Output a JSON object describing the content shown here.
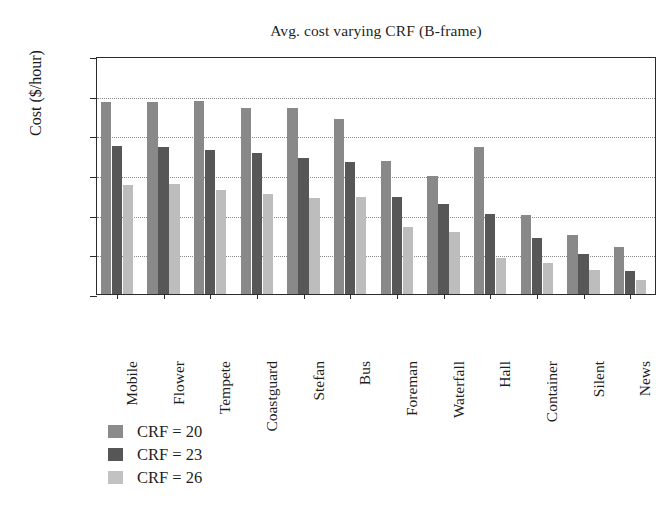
{
  "chart_data": {
    "type": "bar",
    "title": "Avg. cost varying CRF (B-frame)",
    "xlabel": "",
    "ylabel": "Cost ($/hour)",
    "ylim": [
      0.1,
      0.4
    ],
    "yticks": [
      0.1,
      0.15,
      0.2,
      0.25,
      0.3,
      0.35,
      0.4
    ],
    "ytick_labels": [
      "0.1",
      "0.15",
      "0.2",
      "0.25",
      "0.3",
      "0.35",
      "0.4"
    ],
    "grid": true,
    "grid_axis": "y",
    "grid_style": "dotted",
    "legend_position": "below-left",
    "categories": [
      "Mobile",
      "Flower",
      "Tempete",
      "Coastguard",
      "Stefan",
      "Bus",
      "Foreman",
      "Waterfall",
      "Hall",
      "Container",
      "Silent",
      "News"
    ],
    "series": [
      {
        "name": "CRF = 20",
        "color": "#898989",
        "values": [
          0.342,
          0.342,
          0.343,
          0.335,
          0.334,
          0.321,
          0.268,
          0.249,
          0.285,
          0.2,
          0.174,
          0.159
        ]
      },
      {
        "name": "CRF = 23",
        "color": "#575757",
        "values": [
          0.286,
          0.285,
          0.281,
          0.278,
          0.272,
          0.267,
          0.222,
          0.214,
          0.201,
          0.17,
          0.15,
          0.129
        ]
      },
      {
        "name": "CRF = 26",
        "color": "#bdbdbd",
        "values": [
          0.238,
          0.239,
          0.231,
          0.226,
          0.221,
          0.222,
          0.185,
          0.178,
          0.145,
          0.139,
          0.13,
          0.118
        ]
      }
    ]
  },
  "legend": {
    "items": [
      {
        "label": "CRF = 20",
        "swatch": "medium-gray"
      },
      {
        "label": "CRF = 23",
        "swatch": "dark-gray"
      },
      {
        "label": "CRF = 26",
        "swatch": "light-gray"
      }
    ]
  }
}
